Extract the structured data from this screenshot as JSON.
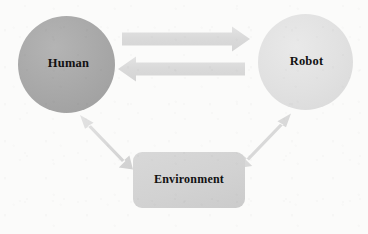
{
  "diagram": {
    "background_color": "#fbfbfa",
    "nodes": [
      {
        "id": "human",
        "label": "Human",
        "shape": "circle",
        "fill": "#a9a9a9",
        "text_color": "#121212"
      },
      {
        "id": "robot",
        "label": "Robot",
        "shape": "circle",
        "fill": "#e1e1e1",
        "text_color": "#121212"
      },
      {
        "id": "environment",
        "label": "Environment",
        "shape": "rounded-rectangle",
        "fill": "#d2d2d2",
        "text_color": "#121212"
      }
    ],
    "connectors": [
      {
        "id": "human-to-robot",
        "from": "human",
        "to": "robot",
        "style": "block-arrow",
        "direction": "right",
        "heads": 1,
        "fill": "#dcdcdc"
      },
      {
        "id": "robot-to-human",
        "from": "robot",
        "to": "human",
        "style": "block-arrow",
        "direction": "left",
        "heads": 1,
        "fill": "#dedede"
      },
      {
        "id": "human-environment",
        "from": "human",
        "to": "environment",
        "style": "block-arrow",
        "direction": "bidirectional",
        "heads": 2,
        "fill": "#dcdcdc"
      },
      {
        "id": "robot-environment",
        "from": "robot",
        "to": "environment",
        "style": "block-arrow",
        "direction": "bidirectional",
        "heads": 2,
        "fill": "#dcdcdc"
      }
    ]
  }
}
